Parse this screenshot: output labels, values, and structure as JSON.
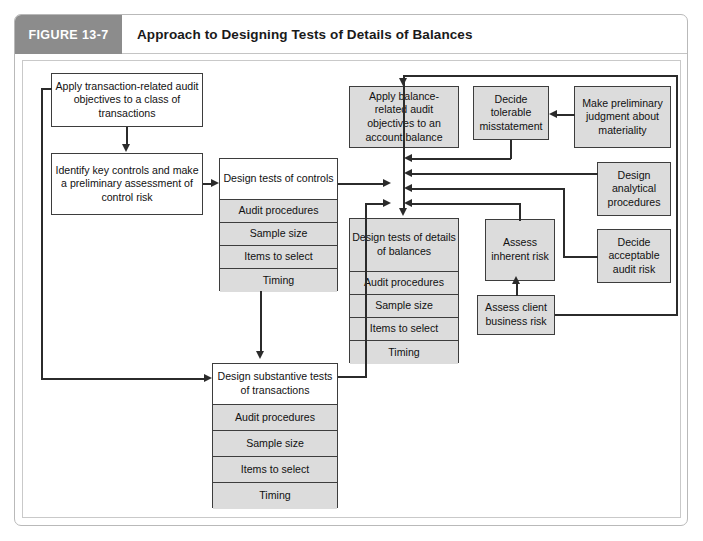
{
  "figure": {
    "tag": "FIGURE 13-7",
    "title": "Approach to Designing Tests of Details of Balances"
  },
  "nodes": {
    "apply_transaction": "Apply transaction-related audit objectives to a class of transactions",
    "identify_key_controls": "Identify key controls and make a preliminary assessment of control risk",
    "apply_balance": "Apply balance-related audit objectives to an account balance",
    "decide_tolerable": "Decide tolerable misstatement",
    "make_preliminary": "Make preliminary judgment about materiality",
    "design_analytical": "Design analytical procedures",
    "decide_acceptable": "Decide acceptable audit risk",
    "assess_inherent": "Assess inherent risk",
    "assess_client": "Assess client business risk"
  },
  "stacks": {
    "tests_of_controls": {
      "header": "Design tests of controls",
      "rows": [
        "Audit procedures",
        "Sample size",
        "Items to select",
        "Timing"
      ]
    },
    "details_of_balances": {
      "header": "Design tests of details of balances",
      "rows": [
        "Audit procedures",
        "Sample size",
        "Items to select",
        "Timing"
      ]
    },
    "substantive_tests": {
      "header": "Design substantive tests of transactions",
      "rows": [
        "Audit procedures",
        "Sample size",
        "Items to select",
        "Timing"
      ]
    }
  },
  "colors": {
    "tag_background": "#8c8c8c",
    "box_gray": "#dcdcdc",
    "box_white": "#ffffff",
    "line": "#2b2b2b",
    "border": "#3d3d3d"
  }
}
